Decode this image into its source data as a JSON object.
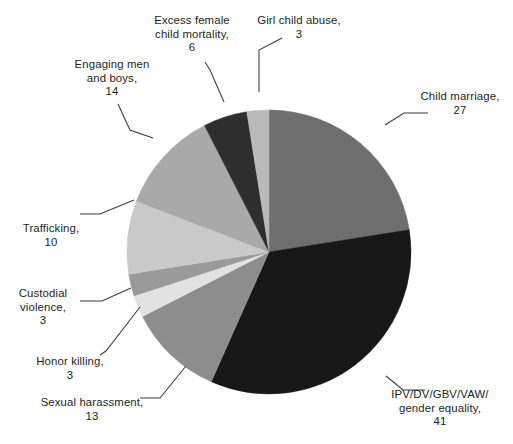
{
  "chart_data": {
    "type": "pie",
    "title": "",
    "subtitle": "",
    "xlabel": "",
    "ylabel": "",
    "legend_position": "none",
    "grid": false,
    "total": 120,
    "start_angle_deg": 0,
    "direction": "clockwise",
    "categories": [
      "Child marriage",
      "IPV/DV/GBV/VAW/ gender equality",
      "Sexual harassment",
      "Honor killing",
      "Custodial violence",
      "Trafficking",
      "Engaging men and boys",
      "Excess female child mortality",
      "Girl child abuse"
    ],
    "values": [
      27,
      41,
      13,
      3,
      3,
      10,
      14,
      6,
      3
    ],
    "colors": [
      "#6e6e6e",
      "#171717",
      "#8d8d8d",
      "#e2e2e2",
      "#9a9a9a",
      "#c9c9c9",
      "#a9a9a9",
      "#2e2e2e",
      "#b9b9b9"
    ],
    "slices": [
      {
        "name": "Child marriage",
        "value": 27,
        "color": "#6e6e6e",
        "start_deg": 0,
        "sweep_deg": 81
      },
      {
        "name": "IPV/DV/GBV/VAW/ gender equality",
        "value": 41,
        "color": "#171717",
        "start_deg": 81,
        "sweep_deg": 123
      },
      {
        "name": "Sexual harassment",
        "value": 13,
        "color": "#8d8d8d",
        "start_deg": 204,
        "sweep_deg": 39
      },
      {
        "name": "Honor killing",
        "value": 3,
        "color": "#e2e2e2",
        "start_deg": 243,
        "sweep_deg": 9
      },
      {
        "name": "Custodial violence",
        "value": 3,
        "color": "#9a9a9a",
        "start_deg": 252,
        "sweep_deg": 9
      },
      {
        "name": "Trafficking",
        "value": 10,
        "color": "#c9c9c9",
        "start_deg": 261,
        "sweep_deg": 30
      },
      {
        "name": "Engaging men and boys",
        "value": 14,
        "color": "#a9a9a9",
        "start_deg": 291,
        "sweep_deg": 42
      },
      {
        "name": "Excess female child mortality",
        "value": 6,
        "color": "#2e2e2e",
        "start_deg": 333,
        "sweep_deg": 18
      },
      {
        "name": "Girl child abuse",
        "value": 3,
        "color": "#b9b9b9",
        "start_deg": 351,
        "sweep_deg": 9
      }
    ]
  },
  "labels": {
    "child_marriage": {
      "text": "Child marriage,\n27"
    },
    "ipv_gender_equality": {
      "text": "IPV/DV/GBV/VAW/\ngender equality,\n41"
    },
    "sexual_harassment": {
      "text": "Sexual harassment,\n13"
    },
    "honor_killing": {
      "text": "Honor killing,\n3"
    },
    "custodial_violence": {
      "text": "Custodial\nviolence,\n3"
    },
    "trafficking": {
      "text": "Trafficking,\n10"
    },
    "engaging_men_and_boys": {
      "text": "Engaging men\nand boys,\n14"
    },
    "excess_female_child_mortality": {
      "text": "Excess female\nchild mortality,\n6"
    },
    "girl_child_abuse": {
      "text": "Girl child abuse,\n3"
    }
  },
  "geometry": {
    "center_x": 269,
    "center_y": 252,
    "radius": 142
  },
  "style": {
    "text_color": "#231f20",
    "background": "#ffffff",
    "leader_line_color": "#3a3a3a"
  }
}
